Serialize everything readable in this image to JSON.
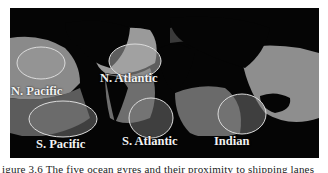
{
  "figure": {
    "gyres": [
      {
        "label": "N. Pacific"
      },
      {
        "label": "N. Atlantic"
      },
      {
        "label": "S. Pacific"
      },
      {
        "label": "S. Atlantic"
      },
      {
        "label": "Indian"
      }
    ],
    "caption": "igure 3.6 The five ocean gyres and their proximity to shipping lanes"
  }
}
